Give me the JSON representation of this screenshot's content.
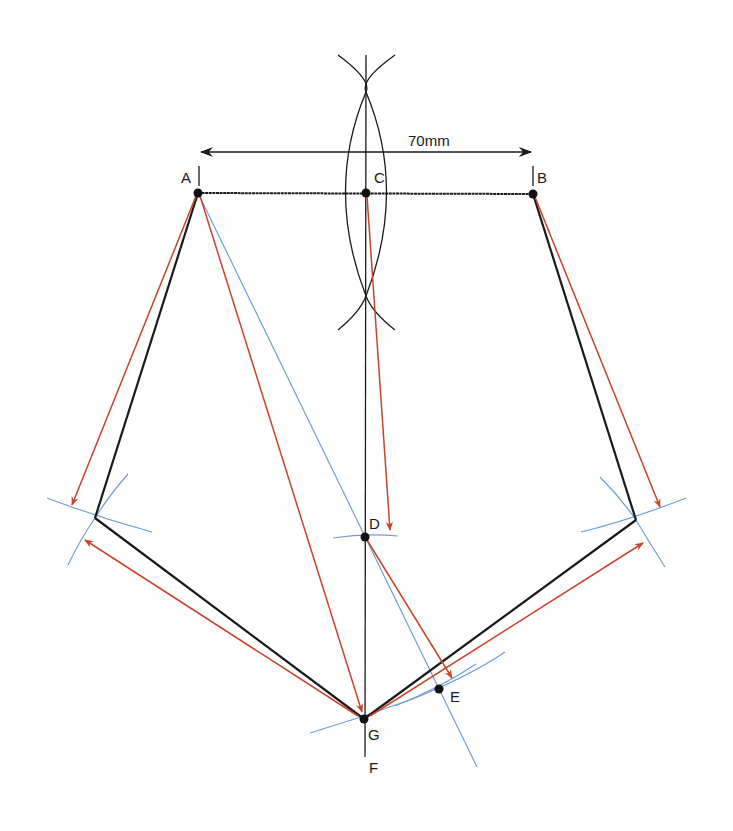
{
  "diagram": {
    "dimension_label": "70mm",
    "colors": {
      "construction_black": "#1a1a1a",
      "arrow_red": "#c8442a",
      "arc_blue": "#6f9fd6"
    },
    "points": {
      "A": {
        "label": "A",
        "x": 198,
        "y": 193
      },
      "B": {
        "label": "B",
        "x": 533,
        "y": 194
      },
      "C": {
        "label": "C",
        "x": 366,
        "y": 193
      },
      "D": {
        "label": "D",
        "x": 365,
        "y": 537
      },
      "E": {
        "label": "E",
        "x": 439,
        "y": 689
      },
      "F": {
        "label": "F",
        "x": 365,
        "y": 757
      },
      "G": {
        "label": "G",
        "x": 364,
        "y": 719
      },
      "left_vertex": {
        "x": 95,
        "y": 518
      },
      "right_vertex": {
        "x": 636,
        "y": 520
      }
    }
  }
}
